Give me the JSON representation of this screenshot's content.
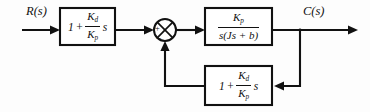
{
  "diagram": {
    "type": "control-system-block-diagram",
    "background_color": "#fdfdfd",
    "line_color": "#111111",
    "signals": {
      "input_label": "R(s)",
      "output_label": "C(s)"
    },
    "summing_junction": {
      "name": "summing-junction",
      "input_sign_left": "+",
      "input_sign_bottom": "−",
      "center_x": 165,
      "center_y": 30,
      "radius": 11
    },
    "blocks": [
      {
        "id": "feedforward",
        "name": "feedforward-block",
        "role": "PD prefilter",
        "lead": "1",
        "operator": "+",
        "numerator": "K",
        "numerator_sub": "d",
        "denominator": "K",
        "denominator_sub": "p",
        "trailing": "s",
        "expression_text": "1 + (K_d / K_p) s"
      },
      {
        "id": "plant",
        "name": "plant-block",
        "role": "Plant transfer function",
        "lead": "",
        "operator": "",
        "numerator": "K",
        "numerator_sub": "p",
        "denominator": "s(Js + b)",
        "denominator_sub": "",
        "trailing": "",
        "expression_text": "K_p / (s(Js + b))"
      },
      {
        "id": "feedback",
        "name": "feedback-block",
        "role": "PD feedback path",
        "lead": "1",
        "operator": "+",
        "numerator": "K",
        "numerator_sub": "d",
        "denominator": "K",
        "denominator_sub": "p",
        "trailing": "s",
        "expression_text": "1 + (K_d / K_p) s"
      }
    ],
    "connections": [
      {
        "name": "wire-input-to-feedforward",
        "from": "R(s)",
        "to": "feedforward-block"
      },
      {
        "name": "wire-feedforward-to-sum",
        "from": "feedforward",
        "to": "summing-junction"
      },
      {
        "name": "wire-sum-to-plant",
        "from": "summing-junction",
        "to": "plant-block"
      },
      {
        "name": "wire-plant-to-output",
        "from": "plant",
        "to": "C(s)"
      },
      {
        "name": "wire-output-tap-down",
        "from": "output-node",
        "to": "feedback-block"
      },
      {
        "name": "wire-feedback-to-sum",
        "from": "feedback",
        "to": "summing-junction"
      }
    ]
  }
}
